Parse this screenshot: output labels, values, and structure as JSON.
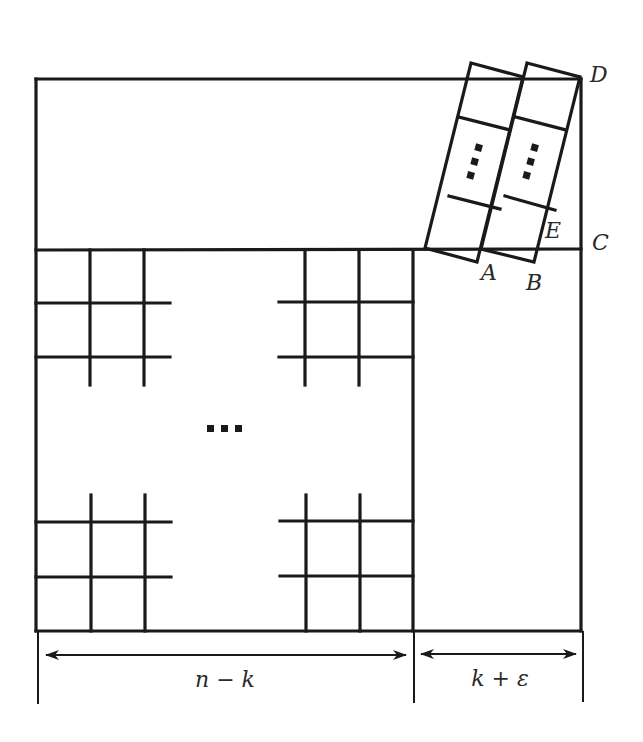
{
  "diagram": {
    "points": {
      "A": "A",
      "B": "B",
      "C": "C",
      "D": "D",
      "E": "E"
    },
    "dimensions": {
      "left": "n − k",
      "right": "k + ε"
    },
    "ellipsis": "⋯",
    "colors": {
      "stroke": "#1a1a1a",
      "background": "#ffffff"
    }
  }
}
